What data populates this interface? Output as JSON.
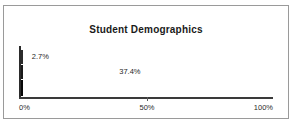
{
  "chart_data": {
    "type": "bar",
    "orientation": "horizontal",
    "title": "Student Demographics",
    "xlabel": "",
    "ylabel": "",
    "xlim": [
      0,
      100
    ],
    "grid": false,
    "legend": "none",
    "xticks": [
      "0%",
      "50%",
      "100%"
    ],
    "xtick_values": [
      0,
      50,
      100
    ],
    "categories": [
      "series-1",
      "series-2",
      "series-3"
    ],
    "values": [
      2.7,
      37.4,
      84.6
    ],
    "data_labels": [
      "2.7%",
      "37.4%",
      "84.6%"
    ],
    "bars": [
      {
        "value": 2.7,
        "label": "2.7%",
        "fill": "light-gray",
        "label_position": "outside",
        "color": "#c9c9c9"
      },
      {
        "value": 37.4,
        "label": "37.4%",
        "fill": "diagonal-hatch",
        "label_position": "outside",
        "color": "#ffffff"
      },
      {
        "value": 84.6,
        "label": "84.6%",
        "fill": "solid-black",
        "label_position": "inside",
        "color": "#080808"
      }
    ]
  },
  "frame": {
    "border_color": "#9a9a9a",
    "background": "#ffffff"
  }
}
